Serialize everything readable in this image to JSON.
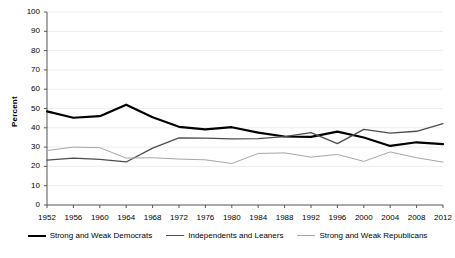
{
  "chart_data": {
    "type": "line",
    "title": "",
    "xlabel": "",
    "ylabel": "Percent",
    "ylim": [
      0,
      100
    ],
    "ytick_step": 10,
    "yticks": [
      100,
      90,
      80,
      70,
      60,
      50,
      40,
      30,
      20,
      10,
      0
    ],
    "grid": true,
    "legend_position": "bottom",
    "categories": [
      1952,
      1956,
      1960,
      1964,
      1968,
      1972,
      1976,
      1980,
      1984,
      1988,
      1992,
      1996,
      2000,
      2004,
      2008,
      2012
    ],
    "xticks": [
      "1952",
      "1956",
      "1960",
      "1964",
      "1968",
      "1972",
      "1976",
      "1980",
      "1984",
      "1988",
      "1992",
      "1996",
      "2000",
      "2004",
      "2008",
      "2012"
    ],
    "series": [
      {
        "name": "Strong and Weak Democrats",
        "color": "#000000",
        "width": 2.2,
        "values": [
          48.5,
          45.2,
          46.0,
          52.0,
          45.5,
          40.5,
          39.2,
          40.3,
          37.5,
          35.5,
          35.3,
          38.0,
          35.0,
          30.6,
          32.5,
          31.5
        ]
      },
      {
        "name": "Independents and Leaners",
        "color": "#4d4d4d",
        "width": 1.3,
        "values": [
          23.2,
          24.3,
          23.6,
          22.3,
          29.5,
          34.8,
          34.7,
          34.3,
          34.4,
          35.4,
          37.5,
          31.8,
          39.2,
          37.2,
          38.2,
          42.2
        ]
      },
      {
        "name": "Strong and Weak Republicans",
        "color": "#a6a6a6",
        "width": 1.0,
        "values": [
          28.2,
          30.0,
          29.7,
          24.3,
          24.5,
          23.8,
          23.4,
          21.5,
          26.7,
          27.0,
          24.8,
          26.2,
          22.6,
          27.5,
          24.5,
          22.2
        ]
      }
    ]
  },
  "legend": {
    "items": [
      {
        "label": "Strong and Weak Democrats"
      },
      {
        "label": "Independents and Leaners"
      },
      {
        "label": "Strong and Weak Republicans"
      }
    ]
  },
  "caption": {
    "text": ""
  }
}
